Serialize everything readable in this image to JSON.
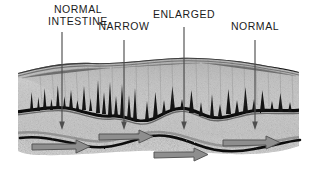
{
  "figure": {
    "background_color": "#ffffff",
    "width": 313,
    "height": 180
  },
  "labels": [
    {
      "id": "normal-intestine",
      "text": "NORMAL\nINTESTINE",
      "x": 34,
      "y": 4,
      "width": 88,
      "pointer_x": 62,
      "pointer_top": 32,
      "pointer_bottom": 128
    },
    {
      "id": "narrow",
      "text": "NARROW",
      "x": 94,
      "y": 20,
      "width": 60,
      "pointer_x": 124,
      "pointer_top": 37,
      "pointer_bottom": 128
    },
    {
      "id": "enlarged",
      "text": "ENLARGED",
      "x": 150,
      "y": 8,
      "width": 68,
      "pointer_x": 184,
      "pointer_top": 25,
      "pointer_bottom": 128
    },
    {
      "id": "normal",
      "text": "NORMAL",
      "x": 226,
      "y": 20,
      "width": 58,
      "pointer_x": 255,
      "pointer_top": 37,
      "pointer_bottom": 128
    }
  ],
  "colors": {
    "ink": "#1b1b1b",
    "pointer_line": "#5a5a5a",
    "tissue_fill": "#c3c3c3",
    "tissue_fill_light": "#d2d2d2",
    "mucosa_dark": "#151515",
    "villi": "#2a2a2a",
    "flow_arrow": "#8c8c8c",
    "flow_arrow_stroke": "#5d5d5d",
    "serosa_line": "#111111",
    "background": "#ffffff"
  },
  "anatomy": {
    "band_top_y": 62,
    "band_bottom_y": 150,
    "segments": [
      {
        "name": "normal-intestine",
        "caliber": "normal",
        "center_x": 62
      },
      {
        "name": "narrow",
        "caliber": "narrow",
        "center_x": 124
      },
      {
        "name": "enlarged",
        "caliber": "enlarged",
        "center_x": 184
      },
      {
        "name": "normal",
        "caliber": "normal",
        "center_x": 255
      }
    ]
  },
  "flow_arrows": [
    {
      "id": "flow-arrow-1",
      "x": 32,
      "y": 140,
      "length": 58,
      "direction": "right"
    },
    {
      "id": "flow-arrow-2",
      "x": 98,
      "y": 131,
      "length": 55,
      "direction": "right"
    },
    {
      "id": "flow-arrow-3",
      "x": 152,
      "y": 146,
      "length": 55,
      "direction": "right"
    },
    {
      "id": "flow-arrow-4",
      "x": 222,
      "y": 136,
      "length": 58,
      "direction": "right"
    }
  ]
}
